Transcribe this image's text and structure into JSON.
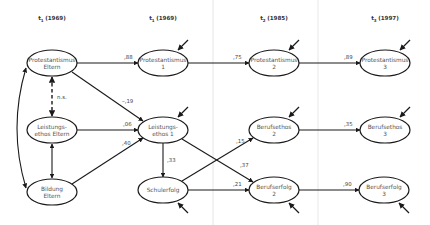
{
  "diagram": {
    "type": "path-model",
    "headers": [
      {
        "id": "t1a",
        "base": "t",
        "sub": "1",
        "year": "(1969)",
        "x": 52
      },
      {
        "id": "t1b",
        "base": "t",
        "sub": "1",
        "year": "(1969)",
        "x": 163
      },
      {
        "id": "t2",
        "base": "t",
        "sub": "2",
        "year": "(1985)",
        "x": 274
      },
      {
        "id": "t3",
        "base": "t",
        "sub": "3",
        "year": "(1997)",
        "x": 385
      }
    ],
    "separators_x": [
      213,
      318
    ],
    "colors": {
      "line": "#1a1a1a",
      "text": "#555555",
      "separator": "#e6e6e6",
      "background": "#ffffff"
    },
    "nodes": [
      {
        "id": "prot_eltern",
        "line1": "Protestantismus",
        "line2": "Eltern",
        "cx": 52,
        "cy": 63,
        "rx": 25,
        "ry": 13
      },
      {
        "id": "leist_eltern",
        "line1": "Leistungs-",
        "line2": "ethos Eltern",
        "cx": 52,
        "cy": 130,
        "rx": 25,
        "ry": 13
      },
      {
        "id": "bildung_eltern",
        "line1": "Bildung",
        "line2": "Eltern",
        "cx": 52,
        "cy": 192,
        "rx": 25,
        "ry": 13
      },
      {
        "id": "prot1",
        "line1": "Protestantismus",
        "line2": "1",
        "cx": 163,
        "cy": 63,
        "rx": 25,
        "ry": 13
      },
      {
        "id": "leist1",
        "line1": "Leistungs-",
        "line2": "ethos 1",
        "cx": 163,
        "cy": 130,
        "rx": 25,
        "ry": 13
      },
      {
        "id": "schulerfolg",
        "line1": "Schulerfolg",
        "line2": "",
        "cx": 163,
        "cy": 190,
        "rx": 25,
        "ry": 13
      },
      {
        "id": "prot2",
        "line1": "Protestantismus",
        "line2": "2",
        "cx": 274,
        "cy": 63,
        "rx": 25,
        "ry": 13
      },
      {
        "id": "berufsethos2",
        "line1": "Berufsethos",
        "line2": "2",
        "cx": 274,
        "cy": 130,
        "rx": 25,
        "ry": 13
      },
      {
        "id": "berufserfolg2",
        "line1": "Berufserfolg",
        "line2": "2",
        "cx": 274,
        "cy": 190,
        "rx": 25,
        "ry": 13
      },
      {
        "id": "prot3",
        "line1": "Protestantismus",
        "line2": "3",
        "cx": 385,
        "cy": 63,
        "rx": 25,
        "ry": 13
      },
      {
        "id": "berufsethos3",
        "line1": "Berufsethos",
        "line2": "3",
        "cx": 385,
        "cy": 130,
        "rx": 25,
        "ry": 13
      },
      {
        "id": "berufserfolg3",
        "line1": "Berufserfolg",
        "line2": "3",
        "cx": 384,
        "cy": 190,
        "rx": 25,
        "ry": 13
      }
    ],
    "paths": [
      {
        "from": "prot_eltern",
        "to": "prot1",
        "coef": ",88",
        "x1": 77,
        "y1": 63,
        "x2": 138,
        "y2": 63,
        "lx": 124,
        "ly": 59
      },
      {
        "from": "prot1",
        "to": "prot2",
        "coef": ",75",
        "x1": 188,
        "y1": 63,
        "x2": 249,
        "y2": 63,
        "lx": 233,
        "ly": 59
      },
      {
        "from": "prot2",
        "to": "prot3",
        "coef": ",89",
        "x1": 299,
        "y1": 63,
        "x2": 360,
        "y2": 63,
        "lx": 344,
        "ly": 59
      },
      {
        "from": "prot_eltern",
        "to": "leist1",
        "coef": "–,19",
        "x1": 72,
        "y1": 72,
        "x2": 143,
        "y2": 121,
        "lx": 122,
        "ly": 103
      },
      {
        "from": "leist_eltern",
        "to": "leist1",
        "coef": ",06",
        "x1": 77,
        "y1": 130,
        "x2": 138,
        "y2": 130,
        "lx": 123,
        "ly": 126
      },
      {
        "from": "bildung_eltern",
        "to": "leist1",
        "coef": ",40",
        "x1": 72,
        "y1": 184,
        "x2": 143,
        "y2": 138,
        "lx": 122,
        "ly": 145
      },
      {
        "from": "leist1",
        "to": "schulerfolg",
        "coef": ",33",
        "x1": 163,
        "y1": 143,
        "x2": 163,
        "y2": 177,
        "lx": 167,
        "ly": 162
      },
      {
        "from": "leist1",
        "to": "berufserfolg2",
        "coef": ",37",
        "x1": 182,
        "y1": 139,
        "x2": 253,
        "y2": 182,
        "lx": 240,
        "ly": 167
      },
      {
        "from": "schulerfolg",
        "to": "berufsethos2",
        "coef": ",15",
        "x1": 182,
        "y1": 181,
        "x2": 253,
        "y2": 138,
        "lx": 236,
        "ly": 143
      },
      {
        "from": "schulerfolg",
        "to": "berufserfolg2",
        "coef": ",21",
        "x1": 188,
        "y1": 190,
        "x2": 249,
        "y2": 190,
        "lx": 233,
        "ly": 186
      },
      {
        "from": "berufsethos2",
        "to": "berufsethos3",
        "coef": ",35",
        "x1": 299,
        "y1": 130,
        "x2": 360,
        "y2": 130,
        "lx": 344,
        "ly": 126
      },
      {
        "from": "berufserfolg2",
        "to": "berufserfolg3",
        "coef": ",90",
        "x1": 299,
        "y1": 190,
        "x2": 359,
        "y2": 190,
        "lx": 343,
        "ly": 186
      }
    ],
    "correlations": [
      {
        "between": [
          "prot_eltern",
          "leist_eltern"
        ],
        "style": "dashed",
        "label": "n.s.",
        "x1": 52,
        "y1": 77,
        "x2": 52,
        "y2": 116,
        "lx": 57,
        "ly": 99
      },
      {
        "between": [
          "leist_eltern",
          "bildung_eltern"
        ],
        "style": "solid",
        "label": "",
        "x1": 52,
        "y1": 144,
        "x2": 52,
        "y2": 178
      },
      {
        "between": [
          "prot_eltern",
          "bildung_eltern"
        ],
        "style": "curved",
        "label": "",
        "d": "M 26 68 Q 8 128 26 188"
      }
    ],
    "error_terms": [
      {
        "node": "prot1",
        "from": "up",
        "x1": 188,
        "y1": 40,
        "x2": 178,
        "y2": 50
      },
      {
        "node": "leist1",
        "from": "up",
        "x1": 188,
        "y1": 107,
        "x2": 178,
        "y2": 117
      },
      {
        "node": "schulerfolg",
        "from": "down",
        "x1": 188,
        "y1": 213,
        "x2": 178,
        "y2": 203
      },
      {
        "node": "prot2",
        "from": "up",
        "x1": 299,
        "y1": 40,
        "x2": 289,
        "y2": 50
      },
      {
        "node": "berufsethos2",
        "from": "up",
        "x1": 299,
        "y1": 107,
        "x2": 289,
        "y2": 117
      },
      {
        "node": "berufserfolg2",
        "from": "down",
        "x1": 299,
        "y1": 213,
        "x2": 289,
        "y2": 203
      },
      {
        "node": "prot3",
        "from": "up",
        "x1": 410,
        "y1": 40,
        "x2": 400,
        "y2": 50
      },
      {
        "node": "berufsethos3",
        "from": "up",
        "x1": 410,
        "y1": 107,
        "x2": 400,
        "y2": 117
      },
      {
        "node": "berufserfolg3",
        "from": "down",
        "x1": 409,
        "y1": 213,
        "x2": 399,
        "y2": 203
      }
    ]
  }
}
